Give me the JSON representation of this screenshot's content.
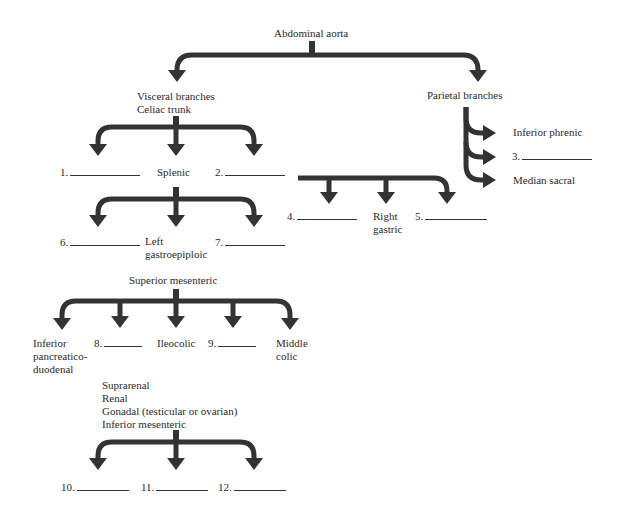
{
  "diagram": {
    "title": "Abdominal aorta",
    "arrow_color": "#333333",
    "nodes": {
      "abdominal_aorta": "Abdominal aorta",
      "visceral": "Visceral branches\nCeliac trunk",
      "parietal": "Parietal branches",
      "inferior_phrenic": "Inferior phrenic",
      "median_sacral": "Median sacral",
      "splenic": "Splenic",
      "left_gastroepiploic": "Left\ngastroepiploic",
      "right_gastric": "Right\ngastric",
      "superior_mesenteric": "Superior mesenteric",
      "inferior_pancreaticoduodenal": "Inferior\npancreatico-\nduodenal",
      "ileocolic": "Ileocolic",
      "middle_colic": "Middle\ncolic",
      "other_branches": "Suprarenal\nRenal\nGonadal (testicular or ovarian)\nInferior mesenteric"
    },
    "blanks": [
      {
        "number": "1.",
        "value": ""
      },
      {
        "number": "2.",
        "value": ""
      },
      {
        "number": "3.",
        "value": ""
      },
      {
        "number": "4.",
        "value": ""
      },
      {
        "number": "5.",
        "value": ""
      },
      {
        "number": "6.",
        "value": ""
      },
      {
        "number": "7.",
        "value": ""
      },
      {
        "number": "8.",
        "value": ""
      },
      {
        "number": "9.",
        "value": ""
      },
      {
        "number": "10.",
        "value": ""
      },
      {
        "number": "11.",
        "value": ""
      },
      {
        "number": "12.",
        "value": ""
      }
    ]
  }
}
